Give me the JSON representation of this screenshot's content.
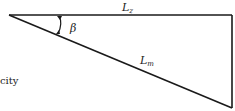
{
  "diagram": {
    "labels": {
      "top_side": {
        "main": "L",
        "sub": "z"
      },
      "hypotenuse": {
        "main": "L",
        "sub": "m"
      },
      "angle": "β"
    },
    "partial_text": "city",
    "colors": {
      "stroke": "#1a1a1a",
      "text": "#222222",
      "background": "#ffffff"
    }
  }
}
